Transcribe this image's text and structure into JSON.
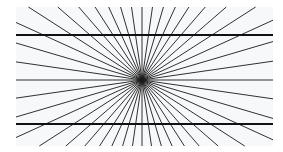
{
  "figure": {
    "name": "hering-illusion",
    "canvas": {
      "width": 283,
      "height": 152,
      "background": "#ffffff"
    },
    "panel": {
      "x": 16,
      "y": 7,
      "width": 257,
      "height": 139,
      "color": "#f7f8fa"
    },
    "center": {
      "x": 142,
      "y": 80
    },
    "rays": {
      "count": 44,
      "color": "#1a1a1a",
      "clip": {
        "x1": 16,
        "y1": 7,
        "x2": 273,
        "y2": 146
      }
    },
    "horizontal_lines": [
      {
        "y": 35,
        "x1": 16,
        "x2": 273,
        "color": "#111111"
      },
      {
        "y": 124,
        "x1": 16,
        "x2": 273,
        "color": "#111111"
      }
    ]
  }
}
